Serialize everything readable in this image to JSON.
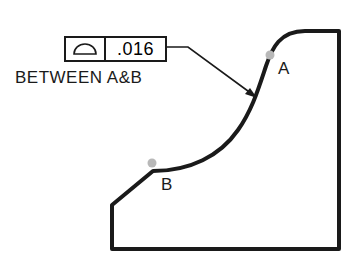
{
  "feature_control_frame": {
    "symbol": "profile-of-a-line-icon",
    "tolerance": ".016"
  },
  "note": "BETWEEN A&B",
  "points": {
    "a": {
      "label": "A"
    },
    "b": {
      "label": "B"
    }
  },
  "colors": {
    "line": "#1a1a1a",
    "point_marker": "#b8b8b8"
  }
}
